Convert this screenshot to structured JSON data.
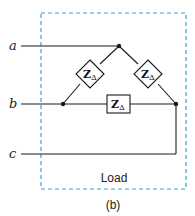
{
  "diagram": {
    "terminals": [
      {
        "id": "a",
        "label": "a"
      },
      {
        "id": "b",
        "label": "b"
      },
      {
        "id": "c",
        "label": "c"
      }
    ],
    "impedances": [
      {
        "id": "z-ab",
        "label": "Z",
        "subscript": "Δ",
        "shape": "diamond"
      },
      {
        "id": "z-ac",
        "label": "Z",
        "subscript": "Δ",
        "shape": "diamond"
      },
      {
        "id": "z-bc",
        "label": "Z",
        "subscript": "Δ",
        "shape": "box"
      }
    ],
    "load_label": "Load",
    "caption": "(b)",
    "colors": {
      "dashed_box": "#3a9fd6",
      "wire": "#1a1a1a"
    }
  }
}
